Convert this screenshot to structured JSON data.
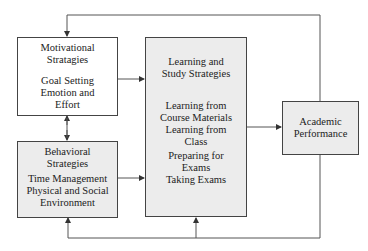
{
  "diagram": {
    "nodes": {
      "motivational": {
        "title": [
          "Motivational",
          "Stratagies"
        ],
        "items": [
          "Goal Setting",
          "Emotion and",
          "Effort"
        ]
      },
      "behavioral": {
        "title": [
          "Behavioral",
          "Strategies"
        ],
        "items": [
          "Time Management",
          "Physical and Social",
          "Environment"
        ]
      },
      "learning": {
        "title": [
          "Learning and",
          "Study Strategies"
        ],
        "items": [
          "Learning from",
          "Course Materials",
          "Learning from",
          "Class",
          "Preparing for",
          "Exams",
          "Taking Exams"
        ]
      },
      "performance": {
        "title": [
          "Academic",
          "Performance"
        ]
      }
    },
    "edges": [
      {
        "from": "motivational",
        "to": "learning"
      },
      {
        "from": "behavioral",
        "to": "learning"
      },
      {
        "from": "motivational",
        "to": "behavioral",
        "bidirectional": true
      },
      {
        "from": "learning",
        "to": "performance"
      },
      {
        "from": "performance",
        "to": "motivational",
        "type": "feedback"
      },
      {
        "from": "performance",
        "to": "behavioral",
        "type": "feedback"
      },
      {
        "from": "performance",
        "to": "learning",
        "type": "feedback"
      }
    ],
    "colors": {
      "line": "#444444",
      "box_fill_gray": "#ececec",
      "box_fill_white": "#ffffff"
    }
  }
}
